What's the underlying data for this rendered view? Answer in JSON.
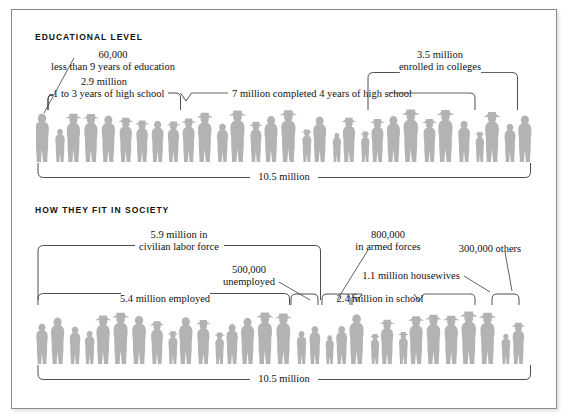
{
  "figure": {
    "kind": "pictogram-infographic",
    "frame_border_color": "#8a8a8a",
    "silhouette_color": "#b3b3b3",
    "line_color": "#3b3b3b"
  },
  "sections": [
    {
      "id": "educational-level",
      "title": "EDUCATIONAL  LEVEL",
      "total_label": "10.5 million",
      "labels": [
        {
          "id": "less-than-9-years",
          "value": "60,000",
          "desc": "less than 9 years of education"
        },
        {
          "id": "one-to-three-years",
          "value": "2.9 million",
          "desc": "1 to 3 years of high school"
        },
        {
          "id": "completed-4-years",
          "value": "",
          "desc": "7 million completed 4 years of high school"
        },
        {
          "id": "enrolled-colleges",
          "value": "3.5 million",
          "desc": "enrolled in colleges"
        }
      ]
    },
    {
      "id": "how-they-fit-in-society",
      "title": "HOW  THEY  FIT  IN  SOCIETY",
      "total_label": "10.5 million",
      "labels": [
        {
          "id": "civilian-labor-force",
          "value": "5.9 million in",
          "desc": "civilian labor force"
        },
        {
          "id": "employed",
          "value": "",
          "desc": "5.4 million employed"
        },
        {
          "id": "unemployed",
          "value": "500,000",
          "desc": "unemployed"
        },
        {
          "id": "armed-forces",
          "value": "800,000",
          "desc": "in armed forces"
        },
        {
          "id": "housewives",
          "value": "",
          "desc": "1.1 million housewives"
        },
        {
          "id": "in-school",
          "value": "",
          "desc": "2.4 million in school"
        },
        {
          "id": "others",
          "value": "",
          "desc": "300,000 others"
        }
      ]
    }
  ],
  "chart_data": {
    "type": "bar",
    "subtitle": "Each row of human silhouettes represents 10.5 million people",
    "xlabel": "",
    "ylabel": "people (millions)",
    "charts": [
      {
        "name": "EDUCATIONAL  LEVEL",
        "total": 10.5,
        "unit": "million",
        "categories": [
          "less than 9 years of education",
          "1 to 3 years of high school",
          "completed 4 years of high school",
          "enrolled in colleges"
        ],
        "values": [
          0.06,
          2.9,
          7.0,
          3.5
        ],
        "value_labels": [
          "60,000",
          "2.9 million",
          "7 million",
          "3.5 million"
        ]
      },
      {
        "name": "HOW  THEY  FIT  IN  SOCIETY",
        "total": 10.5,
        "unit": "million",
        "categories": [
          "employed",
          "unemployed",
          "in armed forces",
          "housewives",
          "in school",
          "others"
        ],
        "values": [
          5.4,
          0.5,
          0.8,
          1.1,
          2.4,
          0.3
        ],
        "value_labels": [
          "5.4 million",
          "500,000",
          "800,000",
          "1.1 million",
          "2.4 million",
          "300,000"
        ],
        "groups": [
          {
            "name": "civilian labor force",
            "value": 5.9,
            "members": [
              "employed",
              "unemployed"
            ]
          }
        ]
      }
    ]
  }
}
